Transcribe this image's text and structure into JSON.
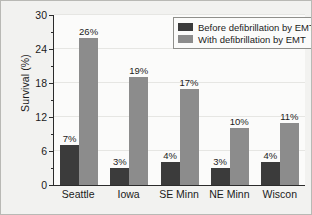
{
  "chart_data": {
    "type": "bar",
    "title": "",
    "xlabel": "",
    "ylabel": "Survival (%)",
    "ylim": [
      0,
      30
    ],
    "yticks": [
      0,
      6,
      12,
      18,
      24,
      30
    ],
    "yticks_minor": [
      3,
      9,
      15,
      21,
      27
    ],
    "grid": true,
    "legend_position": "top-right-inside",
    "categories": [
      "Seattle",
      "Iowa",
      "SE Minn",
      "NE Minn",
      "Wiscon"
    ],
    "series": [
      {
        "name": "Before defibrillation by EMT",
        "color": "#3b3b3b",
        "values": [
          7,
          3,
          4,
          3,
          4
        ],
        "labels": [
          "7%",
          "3%",
          "4%",
          "3%",
          "4%"
        ]
      },
      {
        "name": "With defibrillation by EMT",
        "color": "#8c8c8c",
        "values": [
          26,
          19,
          17,
          10,
          11
        ],
        "labels": [
          "26%",
          "19%",
          "17%",
          "10%",
          "11%"
        ]
      }
    ]
  },
  "axis": {
    "ytick_labels": [
      "0",
      "6",
      "12",
      "18",
      "24",
      "30"
    ]
  },
  "legend": {
    "items": [
      {
        "label": "Before defibrillation by EMT"
      },
      {
        "label": "With defibrillation by EMT"
      }
    ]
  }
}
